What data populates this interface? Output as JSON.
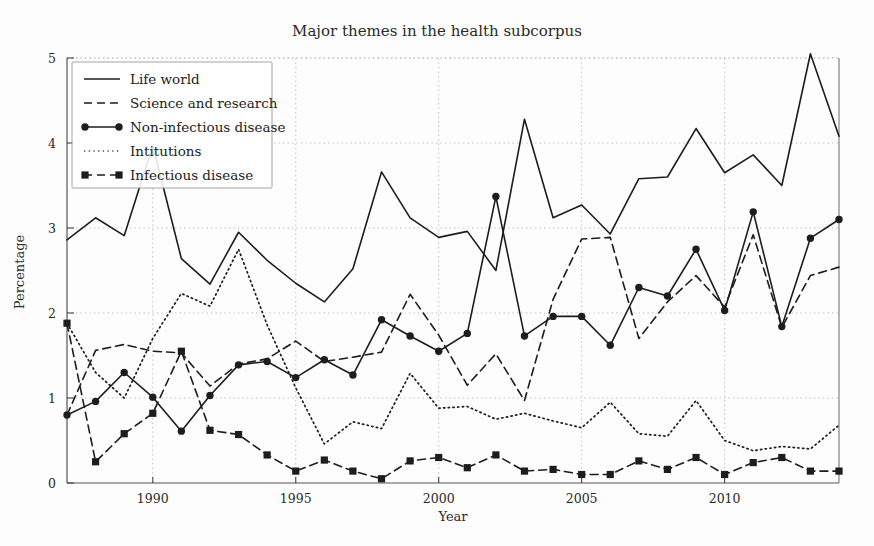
{
  "chart_data": {
    "type": "line",
    "title": "Major themes in the health subcorpus",
    "xlabel": "Year",
    "ylabel": "Percentage",
    "xlim": [
      1987,
      2014
    ],
    "ylim": [
      0,
      5
    ],
    "xticks": [
      1990,
      1995,
      2000,
      2005,
      2010
    ],
    "yticks": [
      0,
      1,
      2,
      3,
      4,
      5
    ],
    "grid": true,
    "legend_position": "top-left",
    "x": [
      1987,
      1988,
      1989,
      1990,
      1991,
      1992,
      1993,
      1994,
      1995,
      1996,
      1997,
      1998,
      1999,
      2000,
      2001,
      2002,
      2003,
      2004,
      2005,
      2006,
      2007,
      2008,
      2009,
      2010,
      2011,
      2012,
      2013,
      2014
    ],
    "series": [
      {
        "name": "Life world",
        "style": "solid",
        "marker": "none",
        "color": "#1d1d1d",
        "values": [
          2.86,
          3.12,
          2.91,
          3.97,
          2.64,
          2.34,
          2.95,
          2.62,
          2.35,
          2.13,
          2.52,
          3.66,
          3.12,
          2.89,
          2.96,
          2.5,
          4.28,
          3.12,
          3.27,
          2.93,
          3.58,
          3.6,
          4.17,
          3.65,
          3.86,
          3.5,
          5.05,
          4.08
        ]
      },
      {
        "name": "Science and research",
        "style": "dashed",
        "marker": "none",
        "color": "#1d1d1d",
        "values": [
          0.8,
          1.56,
          1.63,
          1.55,
          1.53,
          1.14,
          1.4,
          1.46,
          1.67,
          1.43,
          1.48,
          1.54,
          2.22,
          1.74,
          1.15,
          1.52,
          0.97,
          2.16,
          2.87,
          2.89,
          1.7,
          2.13,
          2.44,
          2.07,
          2.92,
          1.83,
          2.44,
          2.54
        ]
      },
      {
        "name": "Non-infectious disease",
        "style": "solid",
        "marker": "circle",
        "color": "#1d1d1d",
        "values": [
          0.8,
          0.96,
          1.3,
          1.01,
          0.61,
          1.03,
          1.39,
          1.43,
          1.24,
          1.45,
          1.27,
          1.92,
          1.73,
          1.55,
          1.76,
          3.37,
          1.73,
          1.96,
          1.96,
          1.62,
          2.3,
          2.2,
          2.75,
          2.03,
          3.19,
          1.84,
          2.88,
          3.1
        ]
      },
      {
        "name": "Intitutions",
        "style": "dotted",
        "marker": "none",
        "color": "#4a4a4a",
        "values": [
          1.88,
          1.3,
          1.0,
          1.7,
          2.23,
          2.08,
          2.75,
          1.86,
          1.12,
          0.46,
          0.72,
          0.64,
          1.29,
          0.88,
          0.9,
          0.75,
          0.82,
          0.73,
          0.65,
          0.95,
          0.58,
          0.55,
          0.97,
          0.5,
          0.38,
          0.43,
          0.4,
          0.68
        ]
      },
      {
        "name": "Infectious disease",
        "style": "dashed",
        "marker": "square",
        "color": "#1d1d1d",
        "values": [
          1.88,
          0.25,
          0.58,
          0.82,
          1.55,
          0.62,
          0.57,
          0.33,
          0.14,
          0.27,
          0.14,
          0.05,
          0.26,
          0.3,
          0.18,
          0.33,
          0.14,
          0.16,
          0.1,
          0.1,
          0.26,
          0.16,
          0.3,
          0.1,
          0.24,
          0.3,
          0.14,
          0.14
        ]
      }
    ]
  },
  "legend": {
    "items": [
      {
        "label": "Life world"
      },
      {
        "label": "Science and research"
      },
      {
        "label": "Non-infectious disease"
      },
      {
        "label": "Intitutions"
      },
      {
        "label": "Infectious disease"
      }
    ]
  },
  "axis": {
    "y_tick_labels": [
      "0",
      "1",
      "2",
      "3",
      "4",
      "5"
    ],
    "x_tick_labels": [
      "1990",
      "1995",
      "2000",
      "2005",
      "2010"
    ]
  }
}
